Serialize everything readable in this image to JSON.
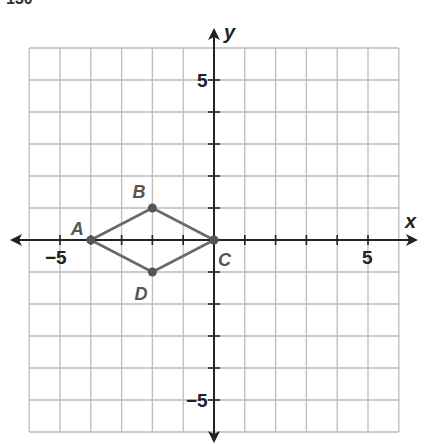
{
  "header": {
    "cropped_text": "130"
  },
  "chart_data": {
    "type": "scatter",
    "title": "",
    "xlabel": "x",
    "ylabel": "y",
    "xlim": [
      -6,
      6
    ],
    "ylim": [
      -6,
      6
    ],
    "grid": true,
    "tick_labels": {
      "x": [
        {
          "value": -5,
          "label": "−5"
        },
        {
          "value": 5,
          "label": "5"
        }
      ],
      "y": [
        {
          "value": 5,
          "label": "5"
        },
        {
          "value": -5,
          "label": "−5"
        }
      ]
    },
    "points": [
      {
        "label": "A",
        "x": -4,
        "y": 0
      },
      {
        "label": "B",
        "x": -2,
        "y": 1
      },
      {
        "label": "C",
        "x": 0,
        "y": 0
      },
      {
        "label": "D",
        "x": -2,
        "y": -1
      }
    ],
    "polygon": [
      "A",
      "B",
      "C",
      "D"
    ]
  },
  "colors": {
    "grid": "#bdbdbd",
    "axis": "#222222",
    "shape": "#6a6a6a",
    "point": "#555555",
    "label": "#555555",
    "tick_label": "#222222"
  }
}
